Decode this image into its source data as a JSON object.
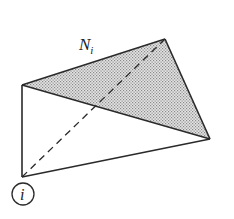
{
  "diagram": {
    "label_top": "N",
    "label_top_subscript": "i",
    "label_vertex": "i",
    "colors": {
      "stroke": "#2a2a2a",
      "shade": "#c8c8c8",
      "background": "#ffffff"
    },
    "vertices": {
      "top_left": [
        22,
        85
      ],
      "top": [
        165,
        39
      ],
      "right": [
        210,
        139
      ],
      "bottom_left": [
        22,
        177
      ]
    },
    "shaded_face": [
      "top_left",
      "top",
      "right"
    ],
    "dashed_edge": [
      "bottom_left",
      "top"
    ]
  }
}
